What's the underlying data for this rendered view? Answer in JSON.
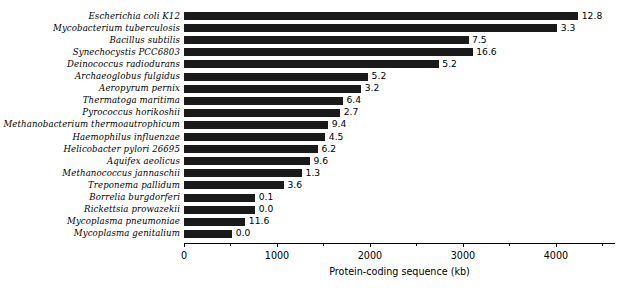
{
  "chart_data": {
    "type": "bar",
    "orientation": "horizontal",
    "title": "",
    "xlabel": "Protein-coding sequence (kb)",
    "ylabel": "",
    "xlim": [
      0,
      4635
    ],
    "xticks": [
      0,
      1000,
      2000,
      3000,
      4000
    ],
    "xtick_labels": [
      "0",
      "1000",
      "2000",
      "3000",
      "4000"
    ],
    "grid": false,
    "legend": null,
    "bar_color": "#1a1a1a",
    "categories": [
      "Escherichia coli K12",
      "Mycobacterium tuberculosis",
      "Bacillus subtilis",
      "Synechocystis PCC6803",
      "Deinococcus radiodurans",
      "Archaeoglobus fulgidus",
      "Aeropyrum pernix",
      "Thermatoga maritima",
      "Pyrococcus horikoshii",
      "Methanobacterium thermoautrophicum",
      "Haemophilus influenzae",
      "Helicobacter pylori 26695",
      "Aquifex aeolicus",
      "Methanococcus jannaschii",
      "Treponema pallidum",
      "Borrelia burgdorferi",
      "Rickettsia prowazekii",
      "Mycoplasma pneumoniae",
      "Mycoplasma genitalium"
    ],
    "values": [
      4240,
      4015,
      3060,
      3105,
      2740,
      1980,
      1905,
      1710,
      1680,
      1550,
      1520,
      1440,
      1355,
      1270,
      1075,
      765,
      765,
      660,
      520
    ],
    "point_labels": [
      "12.8",
      "3.3",
      "7.5",
      "16.6",
      "5.2",
      "5.2",
      "3.2",
      "6.4",
      "2.7",
      "9.4",
      "4.5",
      "6.2",
      "9.6",
      "1.3",
      "3.6",
      "0.1",
      "0.0",
      "11.6",
      "0.0"
    ]
  }
}
